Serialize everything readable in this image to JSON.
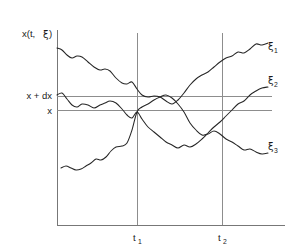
{
  "figure": {
    "kind": "stochastic-sample-paths-diagram",
    "background_color": "#ffffff",
    "curve_color": "#262626",
    "axis_color": "#777777",
    "reference_line_color": "#8d8d8d"
  },
  "axes": {
    "y_axis_label": "x(t, ξ)",
    "y_axis_label_parts": {
      "main": "x(t, ",
      "greek": "ξ",
      "close": ")"
    },
    "x_axis_origin_x": 57,
    "x_axis_y": 225,
    "y_axis_top": 30
  },
  "value_labels": [
    {
      "id": "x-plus-dx",
      "text": "x + dx",
      "y": 96
    },
    {
      "id": "x",
      "text": "x",
      "y": 110
    }
  ],
  "time_markers": [
    {
      "id": "t1",
      "letter": "t",
      "subscript": "1",
      "x": 137
    },
    {
      "id": "t2",
      "letter": "t",
      "subscript": "2",
      "x": 222
    }
  ],
  "curve_labels": [
    {
      "id": "xi1",
      "greek": "ξ",
      "subscript": "1",
      "x": 268,
      "y": 50
    },
    {
      "id": "xi2",
      "greek": "ξ",
      "subscript": "2",
      "x": 268,
      "y": 84
    },
    {
      "id": "xi3",
      "greek": "ξ",
      "subscript": "3",
      "x": 268,
      "y": 150
    }
  ],
  "chart_data": {
    "type": "line",
    "title": "",
    "xlabel": "",
    "ylabel": "x(t, ξ)",
    "grid": false,
    "legend_position": "right-inline",
    "axis_ranges": {
      "x": [
        57,
        285
      ],
      "y": [
        225,
        30
      ]
    },
    "reference_lines": {
      "horizontal": [
        {
          "label": "x + dx",
          "y_pixel": 96
        },
        {
          "label": "x",
          "y_pixel": 110
        }
      ],
      "vertical": [
        {
          "label": "t1",
          "x_pixel": 137
        },
        {
          "label": "t2",
          "x_pixel": 222
        }
      ]
    },
    "series": [
      {
        "name": "ξ1",
        "description": "upper path: starts high, drifts down through x+dx near t1, dips below x, then rises steeply to the top right",
        "points": [
          [
            57,
            48
          ],
          [
            62,
            50
          ],
          [
            67,
            55
          ],
          [
            72,
            58
          ],
          [
            77,
            56
          ],
          [
            82,
            57
          ],
          [
            88,
            62
          ],
          [
            94,
            67
          ],
          [
            100,
            70
          ],
          [
            105,
            69
          ],
          [
            110,
            71
          ],
          [
            116,
            78
          ],
          [
            122,
            83
          ],
          [
            127,
            84
          ],
          [
            132,
            82
          ],
          [
            137,
            89
          ],
          [
            142,
            95
          ],
          [
            148,
            97
          ],
          [
            154,
            96
          ],
          [
            160,
            97
          ],
          [
            166,
            101
          ],
          [
            172,
            104
          ],
          [
            178,
            100
          ],
          [
            184,
            93
          ],
          [
            190,
            85
          ],
          [
            196,
            79
          ],
          [
            202,
            75
          ],
          [
            208,
            72
          ],
          [
            214,
            67
          ],
          [
            220,
            62
          ],
          [
            226,
            58
          ],
          [
            232,
            56
          ],
          [
            238,
            52
          ],
          [
            244,
            53
          ],
          [
            250,
            49
          ],
          [
            256,
            44
          ],
          [
            262,
            45
          ],
          [
            268,
            43
          ]
        ]
      },
      {
        "name": "ξ2",
        "description": "middle path: starts near x+dx, wanders around the band, dips below x mid-range, then climbs to a medium-high level at right",
        "points": [
          [
            57,
            95
          ],
          [
            62,
            93
          ],
          [
            67,
            99
          ],
          [
            72,
            105
          ],
          [
            77,
            107
          ],
          [
            82,
            104
          ],
          [
            88,
            105
          ],
          [
            94,
            108
          ],
          [
            100,
            105
          ],
          [
            105,
            103
          ],
          [
            110,
            101
          ],
          [
            116,
            103
          ],
          [
            122,
            109
          ],
          [
            127,
            115
          ],
          [
            132,
            118
          ],
          [
            137,
            112
          ],
          [
            142,
            119
          ],
          [
            148,
            127
          ],
          [
            154,
            132
          ],
          [
            160,
            137
          ],
          [
            166,
            142
          ],
          [
            172,
            145
          ],
          [
            178,
            148
          ],
          [
            184,
            145
          ],
          [
            190,
            147
          ],
          [
            196,
            144
          ],
          [
            202,
            139
          ],
          [
            208,
            133
          ],
          [
            214,
            127
          ],
          [
            220,
            122
          ],
          [
            226,
            116
          ],
          [
            232,
            110
          ],
          [
            238,
            104
          ],
          [
            244,
            101
          ],
          [
            250,
            95
          ],
          [
            256,
            91
          ],
          [
            262,
            88
          ],
          [
            268,
            87
          ]
        ]
      },
      {
        "name": "ξ3",
        "description": "lower path: starts low-left, rises steadily crossing x and x+dx near t1, peaks, then falls away to the lower right",
        "points": [
          [
            61,
            168
          ],
          [
            66,
            166
          ],
          [
            71,
            168
          ],
          [
            76,
            170
          ],
          [
            81,
            169
          ],
          [
            86,
            166
          ],
          [
            91,
            163
          ],
          [
            96,
            159
          ],
          [
            101,
            160
          ],
          [
            106,
            157
          ],
          [
            111,
            151
          ],
          [
            116,
            147
          ],
          [
            122,
            146
          ],
          [
            127,
            143
          ],
          [
            132,
            130
          ],
          [
            137,
            112
          ],
          [
            142,
            107
          ],
          [
            148,
            104
          ],
          [
            154,
            100
          ],
          [
            160,
            97
          ],
          [
            166,
            95
          ],
          [
            172,
            98
          ],
          [
            178,
            104
          ],
          [
            184,
            112
          ],
          [
            190,
            123
          ],
          [
            196,
            130
          ],
          [
            202,
            135
          ],
          [
            208,
            134
          ],
          [
            214,
            131
          ],
          [
            220,
            134
          ],
          [
            226,
            139
          ],
          [
            232,
            142
          ],
          [
            238,
            146
          ],
          [
            244,
            150
          ],
          [
            250,
            149
          ],
          [
            256,
            152
          ],
          [
            262,
            154
          ],
          [
            268,
            153
          ]
        ]
      }
    ]
  }
}
